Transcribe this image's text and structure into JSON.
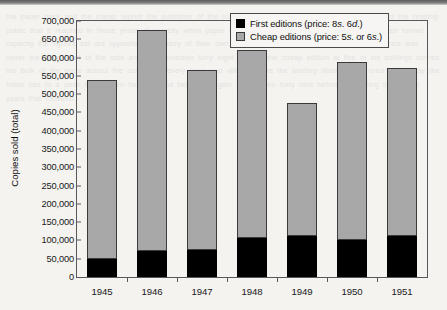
{
  "chart_data": {
    "type": "bar",
    "subtype": "stacked-vertical",
    "title": "",
    "xlabel": "",
    "ylabel": "Copies sold (total)",
    "categories": [
      "1945",
      "1946",
      "1947",
      "1948",
      "1949",
      "1950",
      "1951"
    ],
    "series": [
      {
        "name": "First editions (price: 8s. 6d.)",
        "color": "#000000",
        "values": [
          50000,
          71000,
          75000,
          107000,
          111000,
          101000,
          111000
        ]
      },
      {
        "name": "Cheap editions (price: 5s. or 6s.)",
        "color": "#a8a8a8",
        "values": [
          490000,
          604000,
          492000,
          513000,
          366000,
          486000,
          460000
        ]
      }
    ],
    "totals": [
      540000,
      675000,
      567000,
      620000,
      477000,
      587000,
      571000
    ],
    "ylim": [
      0,
      700000
    ],
    "ytick_step": 50000,
    "ytick_labels": [
      "700,000",
      "650,000",
      "600,000",
      "550,000",
      "500,000",
      "450,000",
      "400,000",
      "350,000",
      "300,000",
      "250,000",
      "200,000",
      "150,000",
      "100,000",
      "50,000",
      "0"
    ],
    "ytick_values": [
      700000,
      650000,
      600000,
      550000,
      500000,
      450000,
      400000,
      350000,
      300000,
      250000,
      200000,
      150000,
      100000,
      50000,
      0
    ],
    "grid": false,
    "legend_position": "top-right",
    "legend": [
      {
        "label_prefix": "First editions (price: 8",
        "unit1": "s",
        "mid": ". 6",
        "unit2": "d",
        "suffix": ".)",
        "swatch": "#000000"
      },
      {
        "label_prefix": "Cheap editions (price: 5",
        "unit1": "s",
        "mid": ". or 6",
        "unit2": "s",
        "suffix": ".)",
        "swatch": "#a8a8a8"
      }
    ]
  },
  "bleed_text": "the paper back and the cheap reprint the publisher of the moment a book is the record of its author and the reading public that it reached in those years of scarcity when paper was rationed and the presses ran at half their former capacity the figures set out opposite tell a story of their own the first edition at eight shillings and sixpence was never the larger part of the sale and from nineteen forty eight onward the cheap edition at five or six shillings carried the bulk of the trade across the counter in every town and village where the lending libraries had once held sway the totals rise to a peak in nineteen forty six and fall away again in nineteen forty nine before recovering in the two years that followed"
}
